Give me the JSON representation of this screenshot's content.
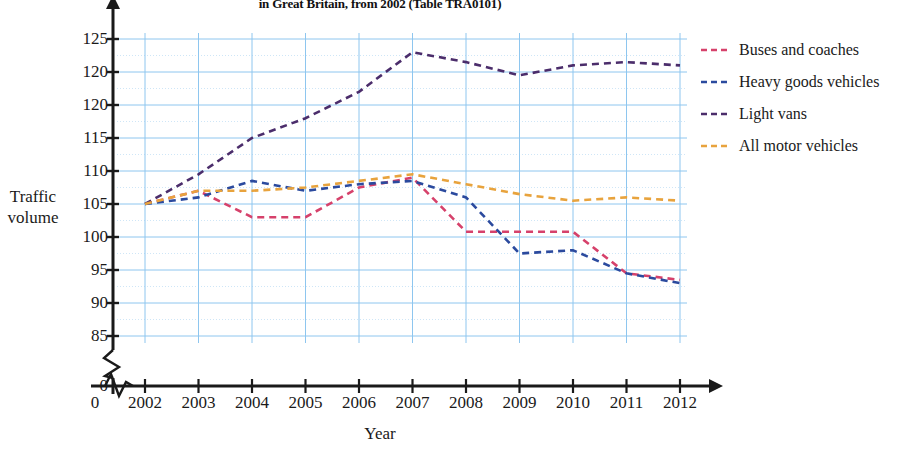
{
  "chart_data": {
    "type": "line",
    "title": "in Great Britain, from 2002 (Table TRA0101)",
    "xlabel": "Year",
    "ylabel": "Traffic volume",
    "ylabel_lines": [
      "Traffic",
      "volume"
    ],
    "grid": true,
    "legend_position": "right",
    "axis_break_x": true,
    "axis_break_y": true,
    "categories": [
      2002,
      2003,
      2004,
      2005,
      2006,
      2007,
      2008,
      2009,
      2010,
      2011,
      2012
    ],
    "xtick_labels": [
      "0",
      "2002",
      "2003",
      "2004",
      "2005",
      "2006",
      "2007",
      "2008",
      "2009",
      "2010",
      "2011",
      "2012"
    ],
    "ytick_labels": [
      "125",
      "120",
      "120",
      "115",
      "110",
      "105",
      "100",
      "95",
      "90",
      "85",
      "0"
    ],
    "ytick_values": [
      125,
      120,
      115,
      110,
      105,
      100,
      95,
      90,
      85
    ],
    "ylim": [
      85,
      125
    ],
    "xlim": [
      2002,
      2012
    ],
    "series": [
      {
        "name": "Buses and coaches",
        "color": "#d6416b",
        "values": [
          100,
          102,
          98,
          98,
          102.5,
          104,
          95.8,
          95.8,
          95.8,
          89.5,
          88.5
        ]
      },
      {
        "name": "Heavy goods vehicles",
        "color": "#2b4a9e",
        "values": [
          100,
          101,
          103.5,
          102,
          103,
          103.5,
          101,
          92.5,
          93,
          89.5,
          88
        ]
      },
      {
        "name": "Light vans",
        "color": "#4b2d6b",
        "values": [
          100,
          104.5,
          110,
          113,
          117,
          123,
          121.5,
          119.5,
          121,
          121.5,
          121
        ]
      },
      {
        "name": "All motor vehicles",
        "color": "#e8a33d",
        "values": [
          100,
          102,
          102,
          102.5,
          103.5,
          104.5,
          103,
          101.5,
          100.5,
          101,
          100.5
        ]
      }
    ]
  },
  "style": {
    "grid_color": "#8ec6ef",
    "grid_minor_color": "#cfe6f7",
    "axis_color": "#1a1a1a",
    "background": "#ffffff"
  },
  "legend": {
    "items": [
      {
        "label": "Buses and coaches",
        "color": "#d6416b"
      },
      {
        "label": "Heavy goods vehicles",
        "color": "#2b4a9e"
      },
      {
        "label": "Light vans",
        "color": "#4b2d6b"
      },
      {
        "label": "All motor vehicles",
        "color": "#e8a33d"
      }
    ]
  }
}
